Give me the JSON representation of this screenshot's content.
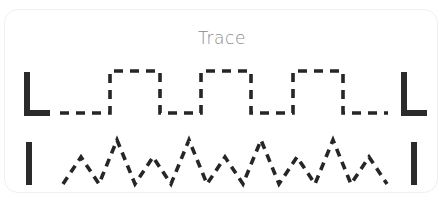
{
  "card": {
    "title": "Trace",
    "background_color": "#ffffff",
    "border_color": "#f0f0f0",
    "title_color": "#8a8a8a",
    "stroke_color": "#262626",
    "guide_color": "#2b2b2b"
  },
  "rows": [
    {
      "name": "square-wave-row",
      "pattern_label": "square wave",
      "left_guide": "L",
      "right_guide": "L",
      "baseline_y": 58,
      "peak_y": 16,
      "pulses": 3
    },
    {
      "name": "zigzag-row",
      "pattern_label": "zigzag",
      "left_guide": "I",
      "right_guide": "I",
      "valley_y": 56,
      "tall_peak_y": 12,
      "short_peak_y": 29,
      "peaks": 9
    }
  ],
  "chart_data": {
    "type": "line",
    "title": "Trace",
    "xlabel": "",
    "ylabel": "",
    "grid": false,
    "legend": "none",
    "series": [
      {
        "name": "square wave",
        "style": "dashed",
        "x": [
          55,
          105,
          105,
          155,
          155,
          196,
          196,
          246,
          246,
          288,
          288,
          338,
          338,
          383
        ],
        "y": [
          58,
          58,
          16,
          16,
          58,
          58,
          16,
          16,
          58,
          58,
          16,
          16,
          58,
          58
        ]
      },
      {
        "name": "zigzag",
        "style": "dashed",
        "x": [
          58,
          76,
          94,
          112,
          130,
          148,
          166,
          184,
          202,
          220,
          238,
          256,
          274,
          292,
          310,
          328,
          346,
          364,
          382
        ],
        "y": [
          56,
          29,
          56,
          12,
          56,
          29,
          56,
          12,
          56,
          29,
          56,
          12,
          56,
          29,
          56,
          12,
          56,
          29,
          56
        ]
      }
    ]
  }
}
